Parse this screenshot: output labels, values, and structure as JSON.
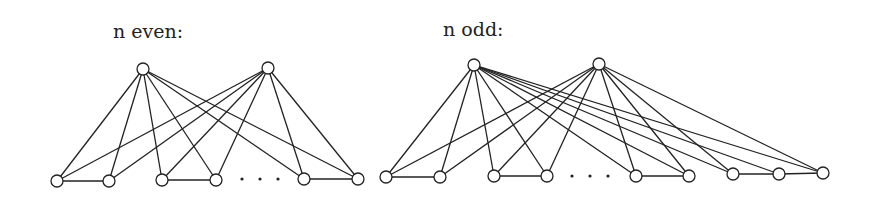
{
  "diagrams": [
    {
      "id": "even",
      "label": "n even:",
      "label_pos": [
        113,
        38
      ],
      "top_nodes": [
        [
          143,
          69
        ],
        [
          268,
          68
        ]
      ],
      "bottom_nodes": [
        [
          57,
          181
        ],
        [
          109,
          181
        ],
        [
          162,
          180
        ],
        [
          216,
          180
        ],
        [
          304,
          179
        ],
        [
          358,
          179
        ]
      ],
      "ellipsis_dots": [
        [
          242,
          179
        ],
        [
          260,
          179
        ],
        [
          278,
          179
        ]
      ],
      "edges_from_top": [
        [
          0,
          1,
          2,
          3,
          4,
          5
        ],
        [
          0,
          1,
          2,
          3,
          4,
          5
        ]
      ],
      "bottom_edges": [
        [
          0,
          1
        ],
        [
          2,
          3
        ],
        [
          4,
          5
        ]
      ]
    },
    {
      "id": "odd",
      "label": "n odd:",
      "label_pos": [
        443,
        36
      ],
      "top_nodes": [
        [
          474,
          65
        ],
        [
          599,
          64
        ]
      ],
      "bottom_nodes": [
        [
          386,
          177
        ],
        [
          440,
          177
        ],
        [
          494,
          176
        ],
        [
          547,
          176
        ],
        [
          636,
          176
        ],
        [
          689,
          176
        ],
        [
          733,
          174
        ],
        [
          779,
          174
        ],
        [
          823,
          173
        ]
      ],
      "ellipsis_dots": [
        [
          572,
          176
        ],
        [
          590,
          176
        ],
        [
          608,
          176
        ]
      ],
      "edges_from_top": [
        [
          0,
          1,
          2,
          3,
          4,
          5,
          6,
          7,
          8
        ],
        [
          0,
          1,
          2,
          3,
          4,
          5,
          6,
          8
        ]
      ],
      "bottom_edges": [
        [
          0,
          1
        ],
        [
          2,
          3
        ],
        [
          4,
          5
        ],
        [
          6,
          7
        ],
        [
          7,
          8
        ]
      ]
    }
  ],
  "node_radius": 6
}
